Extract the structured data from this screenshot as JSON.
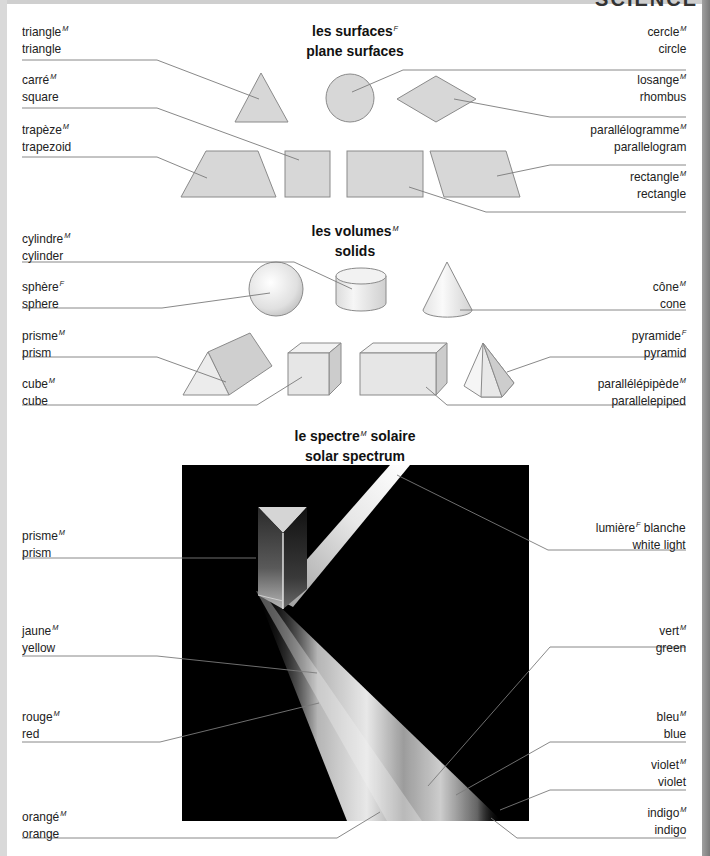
{
  "page_heading": "SCIENCE",
  "sections": {
    "surfaces": {
      "title_fr": "les surfaces",
      "title_fr_gender": "F",
      "title_en": "plane surfaces",
      "labels": [
        {
          "fr": "triangle",
          "g": "M",
          "en": "triangle",
          "side": "left"
        },
        {
          "fr": "carré",
          "g": "M",
          "en": "square",
          "side": "left"
        },
        {
          "fr": "trapèze",
          "g": "M",
          "en": "trapezoid",
          "side": "left"
        },
        {
          "fr": "cercle",
          "g": "M",
          "en": "circle",
          "side": "right"
        },
        {
          "fr": "losange",
          "g": "M",
          "en": "rhombus",
          "side": "right"
        },
        {
          "fr": "parallélogramme",
          "g": "M",
          "en": "parallelogram",
          "side": "right"
        },
        {
          "fr": "rectangle",
          "g": "M",
          "en": "rectangle",
          "side": "right"
        }
      ]
    },
    "solids": {
      "title_fr": "les volumes",
      "title_fr_gender": "M",
      "title_en": "solids",
      "labels": [
        {
          "fr": "cylindre",
          "g": "M",
          "en": "cylinder",
          "side": "left"
        },
        {
          "fr": "sphère",
          "g": "F",
          "en": "sphere",
          "side": "left"
        },
        {
          "fr": "prisme",
          "g": "M",
          "en": "prism",
          "side": "left"
        },
        {
          "fr": "cube",
          "g": "M",
          "en": "cube",
          "side": "left"
        },
        {
          "fr": "cône",
          "g": "M",
          "en": "cone",
          "side": "right"
        },
        {
          "fr": "pyramide",
          "g": "F",
          "en": "pyramid",
          "side": "right"
        },
        {
          "fr": "parallélépipède",
          "g": "M",
          "en": "parallelepiped",
          "side": "right"
        }
      ]
    },
    "spectrum": {
      "title_fr_a": "le spectre",
      "title_fr_gender": "M",
      "title_fr_b": " solaire",
      "title_en": "solar spectrum",
      "labels": [
        {
          "fr": "prisme",
          "g": "M",
          "en": "prism",
          "side": "left"
        },
        {
          "fr": "jaune",
          "g": "M",
          "en": "yellow",
          "side": "left"
        },
        {
          "fr": "rouge",
          "g": "M",
          "en": "red",
          "side": "left"
        },
        {
          "fr": "orangé",
          "g": "M",
          "en": "orange",
          "side": "left"
        },
        {
          "fr": "lumière",
          "g": "F",
          "fr_suffix": " blanche",
          "en": "white light",
          "side": "right"
        },
        {
          "fr": "vert",
          "g": "M",
          "en": "green",
          "side": "right"
        },
        {
          "fr": "bleu",
          "g": "M",
          "en": "blue",
          "side": "right"
        },
        {
          "fr": "violet",
          "g": "M",
          "en": "violet",
          "side": "right"
        },
        {
          "fr": "indigo",
          "g": "M",
          "en": "indigo",
          "side": "right"
        }
      ]
    }
  },
  "colors": {
    "shape_fill": "#d7d7d7",
    "shape_stroke": "#8a8a8a",
    "leader_line": "#7a7a7a",
    "spectrum_bg": "#000000"
  }
}
